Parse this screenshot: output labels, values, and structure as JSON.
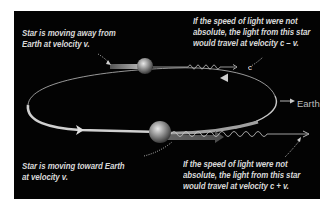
{
  "diagram": {
    "background_color": "#030303",
    "labels": {
      "top_left": [
        "Star is moving away from",
        "Earth at velocity v."
      ],
      "top_right": [
        "If the speed of light were not",
        "absolute, the light from this star",
        "would travel at velocity c – v."
      ],
      "bottom_left": [
        "Star is moving toward  Earth",
        "at velocity v."
      ],
      "bottom_right": [
        "If the speed of light were not",
        "absolute, the light from this star",
        "would travel at velocity c + v."
      ],
      "earth": "Earth"
    },
    "elements": {
      "orbit": "elliptical orbit with direction arrows",
      "star_top": "star receding from Earth",
      "star_bottom": "star approaching Earth",
      "light_wave_top": "wavy light ray c - v",
      "light_wave_bottom": "wavy light ray c + v"
    }
  }
}
